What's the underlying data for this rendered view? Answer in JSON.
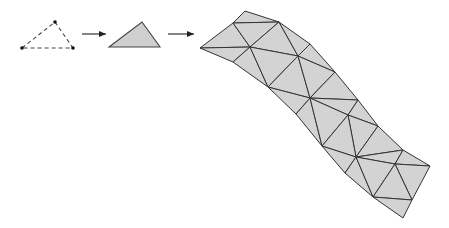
{
  "diagram": {
    "colors": {
      "stroke": "#333333",
      "fill": "#d3d3d3",
      "point": "#111111",
      "background": "#ffffff"
    },
    "stages": [
      {
        "name": "point-triangle",
        "style": "dashed",
        "vertices": 3
      },
      {
        "name": "filled-triangle",
        "style": "solid-filled",
        "vertices": 3
      },
      {
        "name": "triangulated-mesh",
        "style": "solid-filled",
        "topology": "curved strip of triangles"
      }
    ],
    "arrows": [
      {
        "from": "point-triangle",
        "to": "filled-triangle"
      },
      {
        "from": "filled-triangle",
        "to": "triangulated-mesh"
      }
    ]
  }
}
